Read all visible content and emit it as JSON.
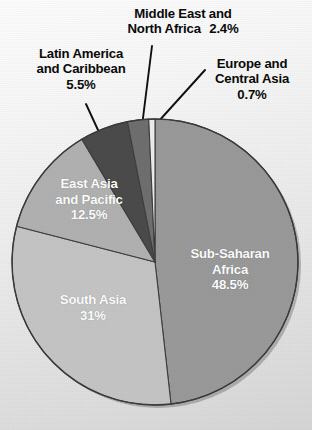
{
  "chart_data": {
    "type": "pie",
    "title": "",
    "subtitle": "",
    "xlabel": "",
    "ylabel": "",
    "legend_position": "none",
    "grid": false,
    "units": "percent",
    "start_angle_deg": 0,
    "direction": "clockwise",
    "categories": [
      "Sub-Saharan Africa",
      "South Asia",
      "East Asia and Pacific",
      "Latin America and Caribbean",
      "Middle East and North Africa",
      "Europe and Central Asia"
    ],
    "values": [
      48.5,
      31,
      12.5,
      5.5,
      2.4,
      0.7
    ],
    "slices": [
      {
        "name": "Sub-Saharan Africa",
        "value": 48.5,
        "label_line1": "Sub-Saharan",
        "label_line2": "Africa",
        "percent_text": "48.5%",
        "color": "#9a9a9a",
        "label_placement": "inside",
        "label_color": "#ffffff"
      },
      {
        "name": "South Asia",
        "value": 31,
        "label_line1": "South Asia",
        "label_line2": "",
        "percent_text": "31%",
        "color": "#c5c5c5",
        "label_placement": "inside",
        "label_color": "#ffffff"
      },
      {
        "name": "East Asia and Pacific",
        "value": 12.5,
        "label_line1": "East Asia",
        "label_line2": "and Pacific",
        "percent_text": "12.5%",
        "color": "#b1b1b1",
        "label_placement": "inside",
        "label_color": "#ffffff"
      },
      {
        "name": "Latin America and Caribbean",
        "value": 5.5,
        "label_line1": "Latin America",
        "label_line2": "and Caribbean",
        "percent_text": "5.5%",
        "color": "#4b4b4b",
        "label_placement": "callout",
        "label_color": "#0b0b0b"
      },
      {
        "name": "Middle East and North Africa",
        "value": 2.4,
        "label_line1": "Middle East and",
        "label_line2": "North Africa",
        "percent_text": "2.4%",
        "color": "#6f6f6f",
        "label_placement": "callout",
        "label_color": "#0b0b0b"
      },
      {
        "name": "Europe and Central Asia",
        "value": 0.7,
        "label_line1": "Europe and",
        "label_line2": "Central Asia",
        "percent_text": "0.7%",
        "color": "#ededed",
        "label_placement": "callout",
        "label_color": "#0b0b0b"
      }
    ],
    "colors": [
      "#9a9a9a",
      "#c5c5c5",
      "#b1b1b1",
      "#4b4b4b",
      "#6f6f6f",
      "#ededed"
    ],
    "background_color": "#eaeaea",
    "outline_color": "#3b3b3b"
  }
}
